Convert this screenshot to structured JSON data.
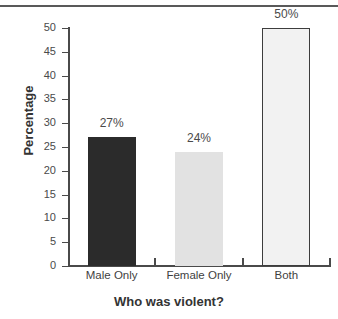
{
  "chart_data": {
    "type": "bar",
    "title": "",
    "subtitle": "",
    "xlabel": "Who was violent?",
    "ylabel": "Percentage",
    "categories": [
      "Male Only",
      "Female Only",
      "Both"
    ],
    "values": [
      27,
      24,
      50
    ],
    "value_labels": [
      "27%",
      "24%",
      "50%"
    ],
    "ylim": [
      0,
      50
    ],
    "ytick_labels": [
      "0",
      "5",
      "10",
      "15",
      "20",
      "25",
      "30",
      "35",
      "40",
      "45",
      "50"
    ],
    "ytick_values": [
      0,
      5,
      10,
      15,
      20,
      25,
      30,
      35,
      40,
      45,
      50
    ],
    "grid": false,
    "legend": false,
    "legend_position": "none",
    "series": [
      {
        "name": "Percentage",
        "values": [
          27,
          24,
          50
        ]
      }
    ],
    "bar_styles": [
      {
        "fill": "#2b2b2b",
        "border": "#2b2b2b"
      },
      {
        "fill": "#e2e2e2",
        "border": "#e2e2e2"
      },
      {
        "fill": "#f2f2f2",
        "border": "#3d3d3d"
      }
    ],
    "axis_color": "#4a4a4a",
    "text_color": "#3a3a3a",
    "background": "#ffffff"
  },
  "figure": {
    "top_rule_color": "#595959"
  }
}
